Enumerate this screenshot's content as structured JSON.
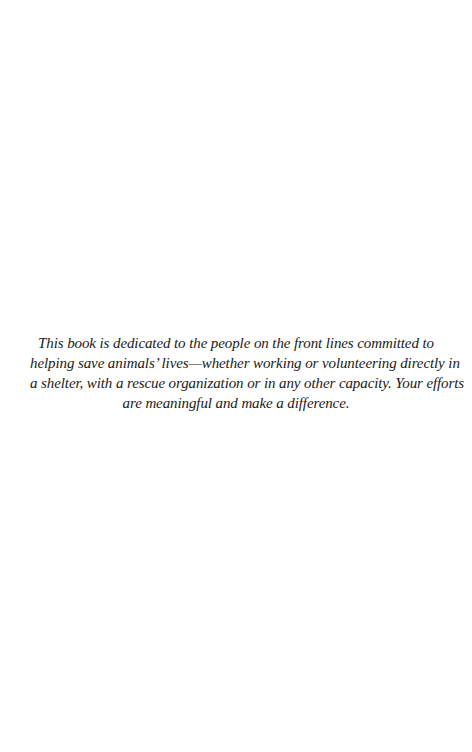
{
  "page": {
    "type": "dedication",
    "background": "#ffffff",
    "text_color": "#1a1a1a"
  },
  "dedication": {
    "lines": [
      "This book is dedicated to the people on the front lines committed to",
      "helping save animals’ lives—whether working or volunteering directly in",
      "a shelter, with a rescue organization or in any other capacity. Your efforts",
      "are meaningful and make a difference."
    ]
  }
}
